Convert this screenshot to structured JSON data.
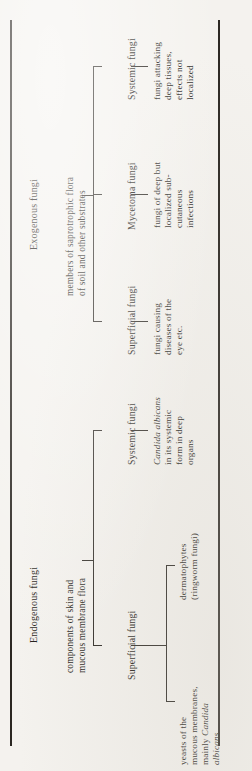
{
  "figure": {
    "orientation": "rotated-90-ccw",
    "background_color": "#f4f2ee",
    "ink_color": "#2b2722",
    "branches": [
      {
        "id": "exogenous",
        "root_label": "Exogenous fungi",
        "root_description": "members of saprotrophic flora\nof soil and other substrates",
        "children": [
          {
            "label": "Superficial fungi",
            "description": "fungi causing\ndiseases of the\neye etc."
          },
          {
            "label": "Mycetoma fungi",
            "description": "fungi of deep but\nlocalized sub-\ncutaneous\ninfections"
          },
          {
            "label": "Systemic fungi",
            "description": "fungi attacking\ndeep tissues,\neffects not\nlocalized"
          }
        ]
      },
      {
        "id": "endogenous",
        "root_label": "Endogenous fungi",
        "root_description": "components of skin and\nmucous membrane flora",
        "children": [
          {
            "label": "Superficial fungi",
            "description": null,
            "subchildren": [
              {
                "description_plain": "dermatophytes\n(ringworm fungi)",
                "line1": "dermatophytes",
                "line2": "(ringworm fungi)",
                "line3": "",
                "line4": ""
              },
              {
                "description_plain": "yeasts of the\nmucous membranes,\nmainly Candida\nalbicans",
                "line1": "yeasts of the",
                "line2": "mucous membranes,",
                "line3": "mainly ",
                "line3_italic": "Candida",
                "line4_italic": "albicans"
              }
            ]
          },
          {
            "label": "Systemic fungi",
            "description_plain": "Candida albicans\nin its systemic\nform in deep\norgans",
            "line1_italic": "Candida albicans",
            "line2": "in its systemic",
            "line3": "form in deep",
            "line4": "organs"
          }
        ]
      }
    ]
  }
}
